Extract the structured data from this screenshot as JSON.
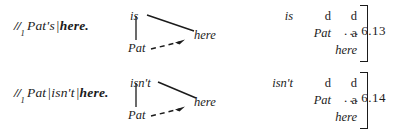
{
  "figure": {
    "background_color": "#ffffff",
    "ink_color": "#1b1b1b"
  },
  "examples": [
    {
      "transcription": {
        "tone_mark": "//",
        "tone_subscript": "1",
        "segments": [
          {
            "text": "Pat's",
            "bold": false,
            "bar_before": false
          },
          {
            "text": "here.",
            "bold": true,
            "bar_before": true
          }
        ]
      },
      "tonogram": {
        "top_label": "is",
        "bottom_label": "Pat",
        "right_label": "here",
        "solid_connector": "top-to-right",
        "vertical_connector": "top-to-bottom",
        "dashed_arrow": "bottom-to-right"
      },
      "matrix": {
        "rows": [
          [
            "is",
            "d",
            "d"
          ],
          [
            "",
            "Pat",
            "a"
          ],
          [
            "",
            "",
            "here"
          ]
        ],
        "styles": [
          [
            "italic",
            "roman",
            "roman"
          ],
          [
            "",
            "italic",
            "roman"
          ],
          [
            "",
            "",
            "italic"
          ]
        ],
        "bracket": "right-square"
      },
      "reference": {
        "dots": "...",
        "number": "6.13"
      }
    },
    {
      "transcription": {
        "tone_mark": "//",
        "tone_subscript": "1",
        "segments": [
          {
            "text": "Pat",
            "bold": false,
            "bar_before": false
          },
          {
            "text": "isn't",
            "bold": false,
            "bar_before": true
          },
          {
            "text": "here.",
            "bold": true,
            "bar_before": true
          }
        ]
      },
      "tonogram": {
        "top_label": "isn't",
        "bottom_label": "Pat",
        "right_label": "here",
        "solid_connector": "top-to-right",
        "vertical_connector": "top-to-bottom",
        "dashed_arrow": "bottom-to-right"
      },
      "matrix": {
        "rows": [
          [
            "isn't",
            "d",
            "d"
          ],
          [
            "",
            "Pat",
            "a"
          ],
          [
            "",
            "",
            "here"
          ]
        ],
        "styles": [
          [
            "italic",
            "roman",
            "roman"
          ],
          [
            "",
            "italic",
            "roman"
          ],
          [
            "",
            "",
            "italic"
          ]
        ],
        "bracket": "right-square"
      },
      "reference": {
        "dots": "...",
        "number": "6.14"
      }
    }
  ]
}
